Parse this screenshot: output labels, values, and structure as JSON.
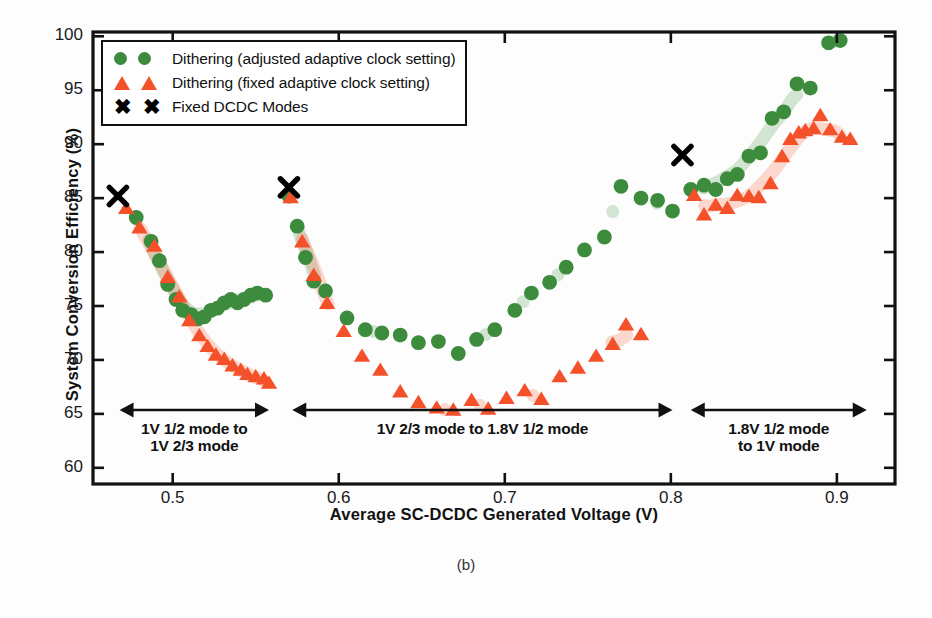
{
  "caption": "(b)",
  "axes": {
    "xlabel": "Average SC-DCDC Generated Voltage (V)",
    "ylabel": "System Conversion Efficiency (%)",
    "xticks": [
      "0.5",
      "0.6",
      "0.7",
      "0.8",
      "0.9"
    ],
    "yticks": [
      "100",
      "95",
      "90",
      "85",
      "80",
      "75",
      "70",
      "65",
      "60"
    ]
  },
  "legend": [
    {
      "marker": "circle",
      "label": "Dithering (adjusted adaptive clock setting)",
      "color": "#3d8b3d"
    },
    {
      "marker": "triangle",
      "label": "Dithering (fixed adaptive clock setting)",
      "color": "#f4502a"
    },
    {
      "marker": "x",
      "label": "Fixed DCDC Modes",
      "color": "#000000"
    }
  ],
  "annotations": [
    {
      "name": "region-1",
      "lines": [
        "1V 1/2 mode to",
        "1V 2/3 mode"
      ],
      "x_start": 0.468,
      "x_end": 0.558
    },
    {
      "name": "region-2",
      "lines": [
        "1V 2/3 mode to 1.8V 1/2 mode"
      ],
      "x_start": 0.572,
      "x_end": 0.801
    },
    {
      "name": "region-3",
      "lines": [
        "1.8V 1/2 mode",
        "to 1V mode"
      ],
      "x_start": 0.812,
      "x_end": 0.918
    }
  ],
  "chart_data": {
    "type": "scatter",
    "title": "",
    "xlabel": "Average SC-DCDC Generated Voltage (V)",
    "ylabel": "System Conversion Efficiency (%)",
    "xlim": [
      0.452,
      0.935
    ],
    "ylim": [
      58.5,
      100.4
    ],
    "xticks": [
      0.5,
      0.6,
      0.7,
      0.8,
      0.9
    ],
    "yticks": [
      60,
      65,
      70,
      75,
      80,
      85,
      90,
      95,
      100
    ],
    "grid": false,
    "legend_position": "top-left",
    "series": [
      {
        "name": "Dithering (adjusted adaptive clock setting)",
        "marker": "circle",
        "color": "#3d8b3d",
        "points": [
          [
            0.478,
            83.2
          ],
          [
            0.487,
            81.0
          ],
          [
            0.492,
            79.2
          ],
          [
            0.497,
            77.0
          ],
          [
            0.502,
            75.6
          ],
          [
            0.506,
            74.6
          ],
          [
            0.511,
            74.2
          ],
          [
            0.515,
            73.8
          ],
          [
            0.519,
            74.0
          ],
          [
            0.523,
            74.6
          ],
          [
            0.527,
            74.8
          ],
          [
            0.531,
            75.3
          ],
          [
            0.535,
            75.6
          ],
          [
            0.539,
            75.3
          ],
          [
            0.543,
            75.6
          ],
          [
            0.547,
            76.0
          ],
          [
            0.551,
            76.2
          ],
          [
            0.556,
            76.0
          ],
          [
            0.57,
            85.2
          ],
          [
            0.575,
            82.4
          ],
          [
            0.58,
            79.5
          ],
          [
            0.585,
            77.3
          ],
          [
            0.592,
            76.4
          ],
          [
            0.605,
            73.9
          ],
          [
            0.616,
            72.8
          ],
          [
            0.626,
            72.5
          ],
          [
            0.637,
            72.3
          ],
          [
            0.648,
            71.6
          ],
          [
            0.66,
            71.7
          ],
          [
            0.672,
            70.6
          ],
          [
            0.683,
            71.9
          ],
          [
            0.694,
            72.8
          ],
          [
            0.706,
            74.6
          ],
          [
            0.716,
            76.2
          ],
          [
            0.727,
            77.2
          ],
          [
            0.737,
            78.6
          ],
          [
            0.748,
            80.2
          ],
          [
            0.76,
            81.4
          ],
          [
            0.77,
            86.1
          ],
          [
            0.782,
            85.0
          ],
          [
            0.792,
            84.8
          ],
          [
            0.801,
            83.8
          ],
          [
            0.812,
            85.8
          ],
          [
            0.82,
            86.2
          ],
          [
            0.827,
            85.8
          ],
          [
            0.834,
            86.8
          ],
          [
            0.84,
            87.2
          ],
          [
            0.847,
            88.9
          ],
          [
            0.854,
            89.2
          ],
          [
            0.861,
            92.4
          ],
          [
            0.868,
            93.0
          ],
          [
            0.876,
            95.6
          ],
          [
            0.884,
            95.2
          ],
          [
            0.895,
            99.4
          ],
          [
            0.902,
            99.6
          ]
        ]
      },
      {
        "name": "Dithering (fixed adaptive clock setting)",
        "marker": "triangle",
        "color": "#f4502a",
        "points": [
          [
            0.472,
            84.0
          ],
          [
            0.48,
            82.2
          ],
          [
            0.489,
            80.5
          ],
          [
            0.497,
            77.6
          ],
          [
            0.504,
            75.8
          ],
          [
            0.51,
            73.6
          ],
          [
            0.516,
            72.2
          ],
          [
            0.521,
            71.2
          ],
          [
            0.526,
            70.4
          ],
          [
            0.531,
            70.0
          ],
          [
            0.536,
            69.4
          ],
          [
            0.541,
            69.0
          ],
          [
            0.545,
            68.6
          ],
          [
            0.55,
            68.4
          ],
          [
            0.555,
            68.2
          ],
          [
            0.558,
            67.8
          ],
          [
            0.571,
            85.0
          ],
          [
            0.578,
            80.9
          ],
          [
            0.585,
            77.8
          ],
          [
            0.593,
            75.2
          ],
          [
            0.603,
            72.6
          ],
          [
            0.614,
            70.3
          ],
          [
            0.625,
            69.0
          ],
          [
            0.637,
            67.0
          ],
          [
            0.648,
            66.0
          ],
          [
            0.659,
            65.5
          ],
          [
            0.669,
            65.3
          ],
          [
            0.68,
            66.2
          ],
          [
            0.69,
            65.4
          ],
          [
            0.701,
            66.4
          ],
          [
            0.712,
            67.1
          ],
          [
            0.722,
            66.3
          ],
          [
            0.733,
            68.4
          ],
          [
            0.744,
            69.2
          ],
          [
            0.755,
            70.3
          ],
          [
            0.765,
            71.4
          ],
          [
            0.773,
            73.2
          ],
          [
            0.782,
            72.3
          ],
          [
            0.814,
            85.2
          ],
          [
            0.82,
            83.4
          ],
          [
            0.827,
            84.3
          ],
          [
            0.834,
            84.0
          ],
          [
            0.84,
            85.2
          ],
          [
            0.847,
            85.1
          ],
          [
            0.853,
            85.0
          ],
          [
            0.86,
            86.3
          ],
          [
            0.867,
            88.8
          ],
          [
            0.872,
            90.4
          ],
          [
            0.877,
            91.0
          ],
          [
            0.881,
            91.2
          ],
          [
            0.886,
            91.4
          ],
          [
            0.89,
            92.6
          ],
          [
            0.896,
            91.3
          ],
          [
            0.903,
            90.6
          ],
          [
            0.908,
            90.4
          ]
        ]
      },
      {
        "name": "Fixed DCDC Modes",
        "marker": "x",
        "color": "#000000",
        "points": [
          [
            0.467,
            85.2
          ],
          [
            0.57,
            86.0
          ],
          [
            0.807,
            89.0
          ]
        ]
      }
    ],
    "trend_bands": [
      {
        "series": "Dithering (adjusted adaptive clock setting)",
        "color": "#3d8b3d"
      },
      {
        "series": "Dithering (fixed adaptive clock setting)",
        "color": "#f4502a"
      }
    ]
  }
}
